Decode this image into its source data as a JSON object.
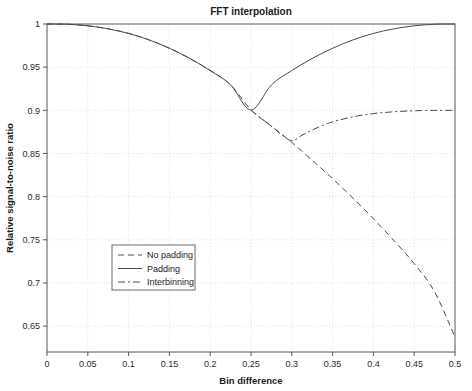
{
  "chart_data": {
    "type": "line",
    "title": "FFT interpolation",
    "xlabel": "Bin difference",
    "ylabel": "Relative signal-to-noise ratio",
    "xlim": [
      0,
      0.5
    ],
    "ylim": [
      0.62,
      1.0
    ],
    "grid": true,
    "legend_position": "lower-left-inside",
    "xticks": [
      0,
      0.05,
      0.1,
      0.15,
      0.2,
      0.25,
      0.3,
      0.35,
      0.4,
      0.45,
      0.5
    ],
    "xticklabels": [
      "0",
      "0.05",
      "0.1",
      "0.15",
      "0.2",
      "0.25",
      "0.3",
      "0.35",
      "0.4",
      "0.45",
      "0.5"
    ],
    "yticks": [
      0.65,
      0.7,
      0.75,
      0.8,
      0.85,
      0.9,
      0.95,
      1
    ],
    "yticklabels": [
      "0.65",
      "0.7",
      "0.75",
      "0.8",
      "0.85",
      "0.9",
      "0.95",
      "1"
    ],
    "series": [
      {
        "name": "No padding",
        "style": "dashed",
        "x": [
          0,
          0.025,
          0.05,
          0.075,
          0.1,
          0.125,
          0.15,
          0.175,
          0.2,
          0.225,
          0.25,
          0.275,
          0.3,
          0.325,
          0.35,
          0.375,
          0.4,
          0.425,
          0.45,
          0.475,
          0.5
        ],
        "y": [
          1.0,
          0.9997,
          0.9979,
          0.9944,
          0.9891,
          0.9816,
          0.9719,
          0.9601,
          0.9461,
          0.9295,
          0.9003,
          0.8817,
          0.8628,
          0.8422,
          0.8208,
          0.7982,
          0.7744,
          0.7492,
          0.7224,
          0.6898,
          0.6372
        ]
      },
      {
        "name": "Padding",
        "style": "solid",
        "x": [
          0,
          0.025,
          0.05,
          0.075,
          0.1,
          0.125,
          0.15,
          0.175,
          0.2,
          0.225,
          0.25,
          0.275,
          0.3,
          0.325,
          0.35,
          0.375,
          0.4,
          0.425,
          0.45,
          0.475,
          0.5
        ],
        "y": [
          1.0,
          0.9997,
          0.9979,
          0.9944,
          0.9891,
          0.9816,
          0.9719,
          0.9601,
          0.9461,
          0.9295,
          0.9003,
          0.9295,
          0.9461,
          0.9601,
          0.9719,
          0.9816,
          0.9891,
          0.9944,
          0.9979,
          0.9997,
          1.0
        ]
      },
      {
        "name": "Interbinning",
        "style": "dashdot",
        "x": [
          0.25,
          0.2625,
          0.275,
          0.2875,
          0.3,
          0.3125,
          0.325,
          0.3375,
          0.35,
          0.375,
          0.4,
          0.425,
          0.45,
          0.475,
          0.5
        ],
        "y": [
          0.9003,
          0.8905,
          0.8817,
          0.8718,
          0.8648,
          0.8712,
          0.8772,
          0.8824,
          0.8866,
          0.8925,
          0.8962,
          0.8983,
          0.8995,
          0.8999,
          0.9
        ]
      }
    ]
  },
  "legend": {
    "entries": [
      {
        "label": "No padding"
      },
      {
        "label": "Padding"
      },
      {
        "label": "Interbinning"
      }
    ]
  },
  "colors": {
    "line": "#4a4a4a",
    "axis": "#555555",
    "grid": "#d8d8d8",
    "background": "#ffffff",
    "text": "#1a1a1a"
  }
}
